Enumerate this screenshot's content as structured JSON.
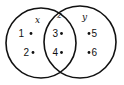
{
  "diagram": {
    "type": "venn",
    "sets": [
      {
        "label": "x",
        "cx": 41,
        "cy": 43,
        "r": 35
      },
      {
        "label": "y",
        "cx": 80,
        "cy": 42,
        "r": 36
      }
    ],
    "intersection_label": "z",
    "regions": {
      "x_only": [
        {
          "label": "1",
          "x": 26,
          "y": 33
        },
        {
          "label": "2",
          "x": 26,
          "y": 53
        }
      ],
      "intersection": [
        {
          "label": "3",
          "x": 55,
          "y": 33
        },
        {
          "label": "4",
          "x": 55,
          "y": 53
        }
      ],
      "y_only": [
        {
          "label": "5",
          "x": 93,
          "y": 33
        },
        {
          "label": "6",
          "x": 93,
          "y": 53
        }
      ]
    },
    "stroke_color": "#111111",
    "background": "#ffffff"
  }
}
